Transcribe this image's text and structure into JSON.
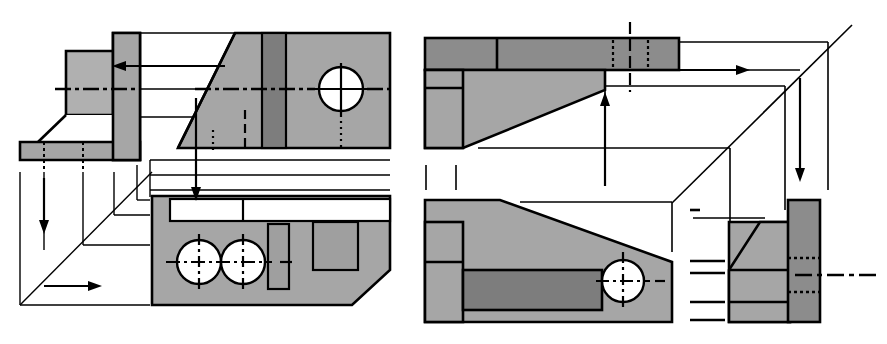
{
  "document": {
    "title": "Orthographic Multiview Projection Drawing",
    "subtitle": "Two third-angle projection layouts of a chamfered bracket",
    "background_color": "#ffffff",
    "line_color": "#000000"
  },
  "palette": {
    "face_light": "#b0b0b0",
    "face_mid": "#a6a6a6",
    "face_dark": "#8c8c8c",
    "face_darker": "#7d7d7d",
    "white": "#ffffff",
    "stroke": "#000000"
  },
  "figures": [
    {
      "id": "figure-left",
      "name": "left-projection-figure",
      "label": "Left multiview layout",
      "origin": {
        "x": 0,
        "y": 0
      },
      "views": [
        {
          "id": "left-side-view",
          "name": "side-view",
          "label": "Side view (L-shaped bracket profile)",
          "fill": "face_light",
          "features": [
            "vertical-wall",
            "horizontal-base",
            "chamfer",
            "hidden-lines",
            "centerline"
          ]
        },
        {
          "id": "left-front-view",
          "name": "front-view",
          "label": "Front view with chamfered corner and through hole",
          "fill": "face_light",
          "features": [
            "chamfer-left",
            "dark-slot-band",
            "circle-with-crosshair",
            "centerline",
            "hidden-line"
          ]
        },
        {
          "id": "left-top-view",
          "name": "top-view",
          "label": "Top view with two holes, narrow slot, wide pocket, corner chamfer",
          "fill": "face_light",
          "features": [
            "two-circles",
            "narrow-slot",
            "wide-pocket",
            "white-rib-channel",
            "corner-chamfer"
          ]
        }
      ],
      "projection": {
        "name": "miter-line-construction",
        "miter_angle_deg": 45,
        "arrows": [
          {
            "name": "arrow-left-horizontal",
            "direction": "left"
          },
          {
            "name": "arrow-down-vertical",
            "direction": "down"
          },
          {
            "name": "arrow-down-left-column",
            "direction": "down"
          },
          {
            "name": "arrow-right-horizontal",
            "direction": "right"
          }
        ]
      }
    },
    {
      "id": "figure-right",
      "name": "right-projection-figure",
      "label": "Right multiview layout",
      "origin": {
        "x": 420,
        "y": 0
      },
      "views": [
        {
          "id": "right-top-view",
          "name": "top-view",
          "label": "Top view band with hidden slot and tapered web",
          "fill": "face_dark",
          "features": [
            "dark-top-band",
            "hidden-slot",
            "tapered-web",
            "left-foot"
          ]
        },
        {
          "id": "right-front-view",
          "name": "front-view",
          "label": "Front view with sloped top, dark recess and through hole",
          "fill": "face_light",
          "features": [
            "sloped-top",
            "dark-recess",
            "circle-with-crosshair",
            "left-foot"
          ]
        },
        {
          "id": "right-side-view",
          "name": "side-view",
          "label": "Right side view with chamfer and hidden slot lines",
          "fill": "face_light",
          "features": [
            "chamfer",
            "dark-right-band",
            "hidden-slot-lines",
            "centerline"
          ]
        }
      ],
      "projection": {
        "name": "miter-line-construction",
        "miter_angle_deg": 45,
        "arrows": [
          {
            "name": "arrow-right-horizontal",
            "direction": "right"
          },
          {
            "name": "arrow-up-vertical",
            "direction": "up"
          },
          {
            "name": "arrow-down-vertical",
            "direction": "down"
          }
        ]
      }
    }
  ],
  "line_styles": {
    "visible": "solid",
    "hidden": "dashed",
    "center": "dash-dot",
    "projection": "thin-solid"
  }
}
